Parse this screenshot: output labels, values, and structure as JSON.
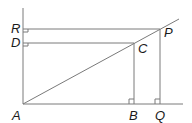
{
  "diagram": {
    "type": "geometry-figure",
    "colors": {
      "line": "#7a7a7a",
      "label": "#1a1a1a",
      "background": "#ffffff"
    },
    "labels": {
      "R": "R",
      "D": "D",
      "P": "P",
      "C": "C",
      "A": "A",
      "B": "B",
      "Q": "Q"
    },
    "points": {
      "A": [
        23,
        104
      ],
      "B": [
        134,
        104
      ],
      "Q": [
        160,
        104
      ],
      "C": [
        134,
        43
      ],
      "P": [
        160,
        29
      ],
      "D": [
        23,
        43
      ],
      "R": [
        23,
        29
      ]
    },
    "segments": [
      "AR (vertical axis)",
      "AQ (horizontal axis)",
      "AP (diagonal)",
      "RP",
      "DC",
      "CB",
      "PQ"
    ],
    "right_angles": [
      "R",
      "D",
      "B",
      "Q"
    ]
  }
}
